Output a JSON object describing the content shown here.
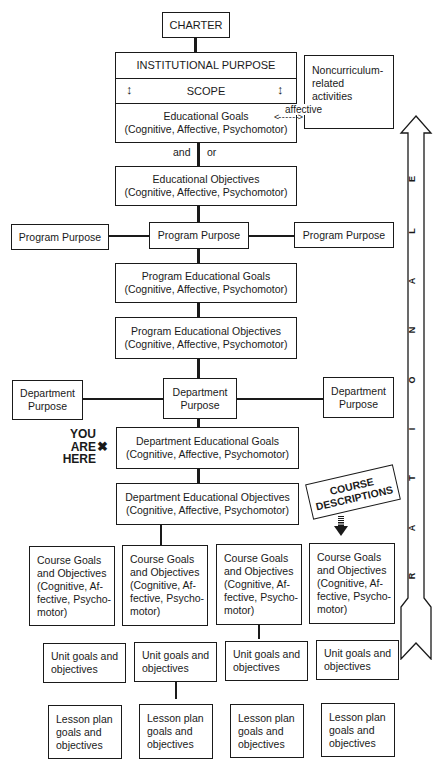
{
  "diagram": {
    "charter": "CHARTER",
    "institutional_purpose": "INSTITUTIONAL PURPOSE",
    "scope": "SCOPE",
    "educational_goals": {
      "title": "Educational Goals",
      "sub": "(Cognitive, Affective, Psychomotor)"
    },
    "affective_label": "affective",
    "noncurriculum": {
      "l1": "Noncurriculum-",
      "l2": "related",
      "l3": "activities"
    },
    "and_label": "and",
    "or_label": "or",
    "educational_objectives": {
      "title": "Educational Objectives",
      "sub": "(Cognitive, Affective, Psychomotor)"
    },
    "program_purpose": [
      "Program Purpose",
      "Program Purpose",
      "Program Purpose"
    ],
    "program_goals": {
      "title": "Program Educational Goals",
      "sub": "(Cognitive, Affective, Psychomotor)"
    },
    "program_objectives": {
      "title": "Program Educational Objectives",
      "sub": "(Cognitive, Affective, Psychomotor)"
    },
    "department_purpose": [
      {
        "l1": "Department",
        "l2": "Purpose"
      },
      {
        "l1": "Department",
        "l2": "Purpose"
      },
      {
        "l1": "Department",
        "l2": "Purpose"
      }
    ],
    "you_are_here": {
      "l1": "YOU",
      "l2": "ARE",
      "l3": "HERE",
      "mark": "✖"
    },
    "department_goals": {
      "title": "Department Educational Goals",
      "sub": "(Cognitive, Affective, Psychomotor)"
    },
    "department_objectives": {
      "title": "Department Educational Objectives",
      "sub": "(Cognitive, Affective, Psychomotor)"
    },
    "course_descriptions": {
      "l1": "COURSE",
      "l2": "DESCRIPTIONS"
    },
    "course_goals": [
      {
        "l1": "Course Goals",
        "l2": "and Objectives",
        "l3": "(Cognitive, Af-",
        "l4": "fective, Psycho-",
        "l5": "motor)"
      },
      {
        "l1": "Course Goals",
        "l2": "and Objectives",
        "l3": "(Cognitive, Af-",
        "l4": "fective, Psycho-",
        "l5": "motor)"
      },
      {
        "l1": "Course Goals",
        "l2": "and Objectives",
        "l3": "(Cognitive, Af-",
        "l4": "fective, Psycho-",
        "l5": "motor)"
      },
      {
        "l1": "Course Goals",
        "l2": "and Objectives",
        "l3": "(Cognitive, Af-",
        "l4": "fective, Psycho-",
        "l5": "motor)"
      }
    ],
    "unit_goals": [
      {
        "l1": "Unit goals and",
        "l2": "objectives"
      },
      {
        "l1": "Unit goals and",
        "l2": "objectives"
      },
      {
        "l1": "Unit goals and",
        "l2": "objectives"
      },
      {
        "l1": "Unit goals and",
        "l2": "objectives"
      }
    ],
    "lesson_plans": [
      {
        "l1": "Lesson plan",
        "l2": "goals and",
        "l3": "objectives"
      },
      {
        "l1": "Lesson plan",
        "l2": "goals and",
        "l3": "objectives"
      },
      {
        "l1": "Lesson plan",
        "l2": "goals and",
        "l3": "objectives"
      },
      {
        "l1": "Lesson plan",
        "l2": "goals and",
        "l3": "objectives"
      }
    ],
    "rationale_letters": [
      "R",
      "A",
      "T",
      "I",
      "O",
      "N",
      "A",
      "L",
      "E"
    ]
  }
}
